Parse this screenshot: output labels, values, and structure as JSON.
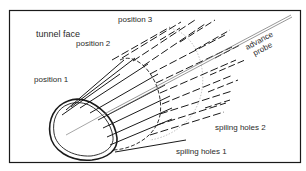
{
  "diagram": {
    "type": "technical-illustration",
    "labels": {
      "tunnel_face": "tunnel face",
      "position_1": "position 1",
      "position_2": "position 2",
      "position_3": "position 3",
      "advance_probe_line1": "advance",
      "advance_probe_line2": "probe",
      "spiling_holes_1": "spiling holes 1",
      "spiling_holes_2": "spiling holes 2"
    },
    "colors": {
      "stroke": "#1a1a1a",
      "light_stroke": "#8a8a8a",
      "background": "#ffffff"
    }
  }
}
